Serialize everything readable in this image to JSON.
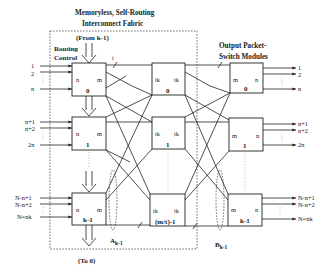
{
  "title": {
    "line1": "Memoryless, Self-Routing",
    "line2": "Interconnect Fabric"
  },
  "right_title": {
    "line1": "Output Packet-",
    "line2": "Switch Modules"
  },
  "routing_control": {
    "line1": "Routing",
    "line2": "Control",
    "from_label": "(From k-1)",
    "to_label": "(To 0)"
  },
  "bus_label": "t",
  "input_modules": [
    {
      "id": "0",
      "left": "n",
      "right": "m",
      "inputs": [
        "1",
        "2",
        "n"
      ]
    },
    {
      "id": "1",
      "left": "n",
      "right": "m",
      "inputs": [
        "n+1",
        "n+2",
        "2n"
      ]
    },
    {
      "id": "k-1",
      "left": "n",
      "right": "m",
      "inputs": [
        "N-n+1",
        "N-n+2",
        "N=nk"
      ]
    }
  ],
  "middle_modules": [
    {
      "id": "0",
      "left": "tk",
      "right": "tk"
    },
    {
      "id": "1",
      "left": "tk",
      "right": "tk"
    },
    {
      "id": "(m/t)-1",
      "left": "tk",
      "right": "tk"
    }
  ],
  "output_modules": [
    {
      "id": "0",
      "left": "m",
      "right": "n",
      "outputs": [
        "1",
        "2",
        "n"
      ]
    },
    {
      "id": "1",
      "left": "m",
      "right": "n",
      "outputs": [
        "n+1",
        "n+2",
        "2n"
      ]
    },
    {
      "id": "k-1",
      "left": "m",
      "right": "n",
      "outputs": [
        "N-n+1",
        "N-n+2",
        "N=nk"
      ]
    }
  ],
  "group_labels": {
    "a": "A",
    "a_sub": "k-1",
    "b": "B",
    "b_sub": "k-1"
  }
}
